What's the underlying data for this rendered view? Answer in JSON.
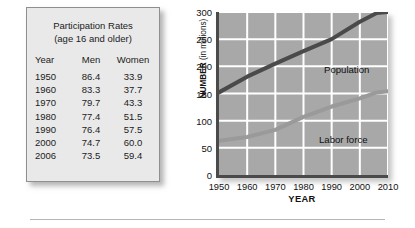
{
  "table": {
    "title_line1": "Participation Rates",
    "title_line2": "(age 16 and older)",
    "columns": [
      "Year",
      "Men",
      "Women"
    ],
    "rows": [
      [
        "1950",
        "86.4",
        "33.9"
      ],
      [
        "1960",
        "83.3",
        "37.7"
      ],
      [
        "1970",
        "79.7",
        "43.3"
      ],
      [
        "1980",
        "77.4",
        "51.5"
      ],
      [
        "1990",
        "76.4",
        "57.5"
      ],
      [
        "2000",
        "74.7",
        "60.0"
      ],
      [
        "2006",
        "73.5",
        "59.4"
      ]
    ]
  },
  "chart_data": {
    "type": "line",
    "title": "",
    "xlabel": "YEAR",
    "ylabel": "NUMBER (in millions)",
    "ylabel_main": "NUMBER",
    "ylabel_unit": " (in millions)",
    "x": [
      1950,
      1960,
      1970,
      1980,
      1990,
      2000,
      2006,
      2010
    ],
    "xlim": [
      1950,
      2010
    ],
    "ylim": [
      0,
      300
    ],
    "xticks": [
      "1950",
      "1960",
      "1970",
      "1980",
      "1990",
      "2000",
      "2010"
    ],
    "yticks": [
      "0",
      "50",
      "100",
      "150",
      "200",
      "250",
      "300"
    ],
    "grid": true,
    "legend_position": "inline-annotation",
    "series": [
      {
        "name": "Population",
        "color": "#4a4a4a",
        "values": [
          152,
          181,
          205,
          228,
          250,
          282,
          298,
          300
        ]
      },
      {
        "name": "Labor force",
        "color": "#9a9a9a",
        "values": [
          63,
          70,
          83,
          107,
          126,
          141,
          152,
          154
        ]
      }
    ],
    "plot_background": "#a8a8a8",
    "gridline_color": "#ffffff",
    "axis_color": "#4a4a4a"
  }
}
